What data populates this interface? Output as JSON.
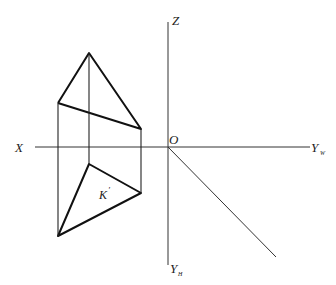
{
  "diagram": {
    "type": "orthographic projection (three-view) of a triangular pyramid / prism",
    "axes": {
      "x_label": "X",
      "z_label": "Z",
      "origin_label": "O",
      "yw_label": "Y",
      "yw_sub": "W",
      "yh_label": "Y",
      "yh_sub": "H"
    },
    "point_label": "K",
    "point_label_mark": "′",
    "colors": {
      "line": "#222222",
      "background": "#ffffff"
    }
  }
}
